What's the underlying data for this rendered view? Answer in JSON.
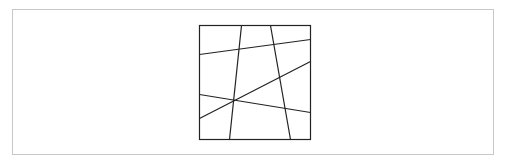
{
  "diagram": {
    "type": "square-partition",
    "frame": {
      "x": 12,
      "y": 9,
      "width": 482,
      "height": 146,
      "stroke": "#c8c8c8"
    },
    "square": {
      "x": 199,
      "y": 25,
      "width": 111,
      "height": 114,
      "stroke": "#222222"
    },
    "line_color": "#222222",
    "line_width": 1.2,
    "segments": [
      {
        "id": "line-upper-horizontal",
        "x1": 199,
        "y1": 54,
        "x2": 310,
        "y2": 39
      },
      {
        "id": "line-diagonal",
        "x1": 199,
        "y1": 118,
        "x2": 310,
        "y2": 61
      },
      {
        "id": "line-lower-horizontal",
        "x1": 199,
        "y1": 94,
        "x2": 310,
        "y2": 112
      },
      {
        "id": "line-left-vertical",
        "x1": 241,
        "y1": 25,
        "x2": 229,
        "y2": 139
      },
      {
        "id": "line-right-vertical",
        "x1": 270,
        "y1": 25,
        "x2": 290,
        "y2": 139
      }
    ]
  }
}
